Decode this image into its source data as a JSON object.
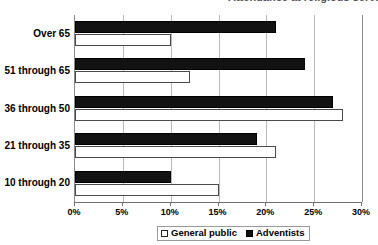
{
  "title": {
    "text": "Attendance at religious services",
    "visible": "cut-off"
  },
  "legend": {
    "position": "bottom",
    "items": [
      {
        "label": "General public",
        "swatch": "hollow-square-icon",
        "color": "#ffffff"
      },
      {
        "label": "Adventists",
        "swatch": "filled-square-icon",
        "color": "#111111"
      }
    ]
  },
  "axes": {
    "x": {
      "label": "",
      "ticks": [
        "0%",
        "5%",
        "10%",
        "15%",
        "20%",
        "25%",
        "30%"
      ],
      "min": 0,
      "max": 30
    },
    "y": {
      "label": "",
      "categories": [
        "Over 65",
        "51 through 65",
        "36 through 50",
        "21 through 35",
        "10 through 20"
      ]
    }
  },
  "chart_data": {
    "type": "bar",
    "orientation": "horizontal",
    "title": "Attendance at religious services",
    "xlabel": "",
    "ylabel": "",
    "xlim": [
      0,
      30
    ],
    "xtick_format": "percent",
    "xticks": [
      0,
      5,
      10,
      15,
      20,
      25,
      30
    ],
    "grid": true,
    "grid_axis": "x",
    "legend_position": "bottom",
    "categories": [
      "Over 65",
      "51 through 65",
      "36 through 50",
      "21 through 35",
      "10 through 20"
    ],
    "series": [
      {
        "name": "Adventists",
        "color": "#111111",
        "values": [
          21,
          24,
          27,
          19,
          10
        ]
      },
      {
        "name": "General public",
        "color": "#ffffff",
        "values": [
          10,
          12,
          28,
          21,
          15
        ]
      }
    ]
  }
}
